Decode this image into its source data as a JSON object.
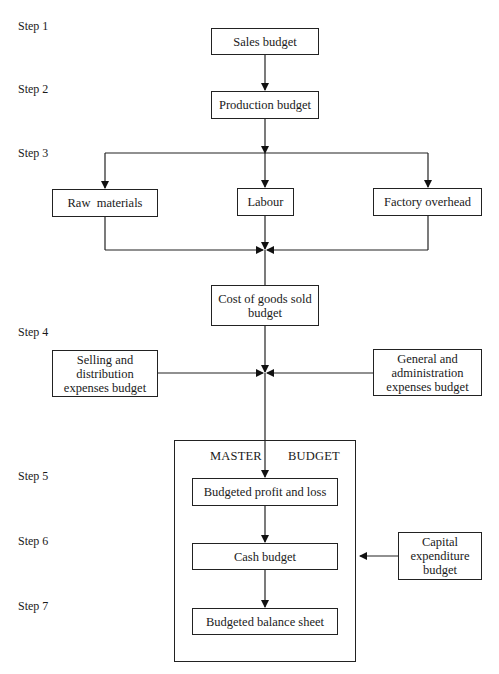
{
  "diagram": {
    "steps": [
      "Step 1",
      "Step 2",
      "Step 3",
      "Step 4",
      "Step 5",
      "Step 6",
      "Step 7"
    ],
    "nodes": {
      "sales": "Sales budget",
      "production": "Production budget",
      "raw_materials": "Raw  materials",
      "labour": "Labour",
      "factory_overhead": "Factory overhead",
      "cogs_line1": "Cost of goods sold",
      "cogs_line2": "budget",
      "selling_line1": "Selling and",
      "selling_line2": "distribution",
      "selling_line3": "expenses budget",
      "general_line1": "General and",
      "general_line2": "administration",
      "general_line3": "expenses budget",
      "master_left": "MASTER",
      "master_right": "BUDGET",
      "profit_loss": "Budgeted profit and loss",
      "cash": "Cash budget",
      "balance_sheet": "Budgeted balance sheet",
      "capital_line1": "Capital",
      "capital_line2": "expenditure",
      "capital_line3": "budget"
    },
    "edges": [
      [
        "Sales budget",
        "Production budget"
      ],
      [
        "Production budget",
        "Raw materials"
      ],
      [
        "Production budget",
        "Labour"
      ],
      [
        "Production budget",
        "Factory overhead"
      ],
      [
        "Raw materials",
        "Cost of goods sold budget"
      ],
      [
        "Labour",
        "Cost of goods sold budget"
      ],
      [
        "Factory overhead",
        "Cost of goods sold budget"
      ],
      [
        "Cost of goods sold budget",
        "Master budget"
      ],
      [
        "Selling and distribution expenses budget",
        "Master budget"
      ],
      [
        "General and administration expenses budget",
        "Master budget"
      ],
      [
        "Budgeted profit and loss",
        "Cash budget"
      ],
      [
        "Capital expenditure budget",
        "Cash budget"
      ],
      [
        "Cash budget",
        "Budgeted balance sheet"
      ]
    ]
  }
}
